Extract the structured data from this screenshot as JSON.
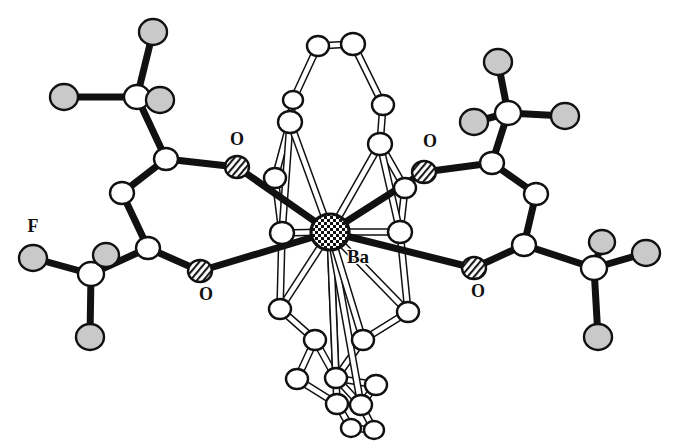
{
  "figure": {
    "kind": "crystal-structure-ortep-diagram",
    "title": "",
    "caption": "",
    "background_color": "#ffffff",
    "line_color": "#111111",
    "fill_white": "#ffffff",
    "fill_gray": "#c9c9c9",
    "metal_fill": "#1a1a1a"
  },
  "labels": [
    {
      "id": "label-o-upper-left",
      "text": "O",
      "x": 237,
      "y": 141,
      "kind": "oxygen"
    },
    {
      "id": "label-o-lower-left",
      "text": "O",
      "x": 206,
      "y": 296,
      "kind": "oxygen"
    },
    {
      "id": "label-o-upper-right",
      "text": "O",
      "x": 430,
      "y": 143,
      "kind": "oxygen"
    },
    {
      "id": "label-o-lower-right",
      "text": "O",
      "x": 478,
      "y": 293,
      "kind": "oxygen"
    },
    {
      "id": "label-f-left",
      "text": "F",
      "x": 33,
      "y": 228,
      "kind": "fluorine"
    },
    {
      "id": "label-ba-center",
      "text": "Ba",
      "x": 358,
      "y": 259,
      "kind": "metal"
    }
  ],
  "chart_data": {
    "type": "scatter",
    "xlabel": "",
    "ylabel": "",
    "legend": [
      {
        "name": "carbon / backbone atom",
        "style": "white ellipse, black outline"
      },
      {
        "name": "fluorine atom",
        "style": "light gray ellipse"
      },
      {
        "name": "oxygen atom",
        "style": "white ellipse with diagonal hatch"
      },
      {
        "name": "barium atom",
        "style": "checkerboard-filled ellipse"
      }
    ],
    "atoms": [
      {
        "id": "Ba1",
        "element": "Ba",
        "x": 330,
        "y": 232,
        "rx": 19,
        "ry": 18,
        "style": "metal"
      },
      {
        "id": "O1",
        "element": "O",
        "x": 237,
        "y": 167,
        "rx": 12,
        "ry": 11,
        "style": "hatch"
      },
      {
        "id": "O2",
        "element": "O",
        "x": 200,
        "y": 271,
        "rx": 12,
        "ry": 11,
        "style": "hatch"
      },
      {
        "id": "O3",
        "element": "O",
        "x": 424,
        "y": 172,
        "rx": 12,
        "ry": 11,
        "style": "hatch"
      },
      {
        "id": "O4",
        "element": "O",
        "x": 474,
        "y": 268,
        "rx": 12,
        "ry": 11,
        "style": "hatch"
      },
      {
        "id": "C1",
        "element": "C",
        "x": 166,
        "y": 159,
        "rx": 12,
        "ry": 11,
        "style": "white"
      },
      {
        "id": "C2",
        "element": "C",
        "x": 122,
        "y": 193,
        "rx": 12,
        "ry": 11,
        "style": "white"
      },
      {
        "id": "C3",
        "element": "C",
        "x": 148,
        "y": 248,
        "rx": 12,
        "ry": 11,
        "style": "white"
      },
      {
        "id": "C4",
        "element": "C",
        "x": 137,
        "y": 97,
        "rx": 13,
        "ry": 12,
        "style": "white"
      },
      {
        "id": "C5",
        "element": "C",
        "x": 91,
        "y": 274,
        "rx": 13,
        "ry": 12,
        "style": "white"
      },
      {
        "id": "F1",
        "element": "F",
        "x": 153,
        "y": 32,
        "rx": 14,
        "ry": 13,
        "style": "gray"
      },
      {
        "id": "F2",
        "element": "F",
        "x": 64,
        "y": 97,
        "rx": 14,
        "ry": 13,
        "style": "gray"
      },
      {
        "id": "F3",
        "element": "F",
        "x": 160,
        "y": 100,
        "rx": 14,
        "ry": 13,
        "style": "gray"
      },
      {
        "id": "F4",
        "element": "F",
        "x": 33,
        "y": 258,
        "rx": 14,
        "ry": 13,
        "style": "gray"
      },
      {
        "id": "F5",
        "element": "F",
        "x": 106,
        "y": 255,
        "rx": 13,
        "ry": 12,
        "style": "gray"
      },
      {
        "id": "F6",
        "element": "F",
        "x": 90,
        "y": 337,
        "rx": 14,
        "ry": 13,
        "style": "gray"
      },
      {
        "id": "C6",
        "element": "C",
        "x": 492,
        "y": 163,
        "rx": 12,
        "ry": 11,
        "style": "white"
      },
      {
        "id": "C7",
        "element": "C",
        "x": 536,
        "y": 194,
        "rx": 12,
        "ry": 11,
        "style": "white"
      },
      {
        "id": "C8",
        "element": "C",
        "x": 524,
        "y": 245,
        "rx": 12,
        "ry": 11,
        "style": "white"
      },
      {
        "id": "C9",
        "element": "C",
        "x": 508,
        "y": 113,
        "rx": 13,
        "ry": 12,
        "style": "white"
      },
      {
        "id": "C10",
        "element": "C",
        "x": 594,
        "y": 268,
        "rx": 13,
        "ry": 12,
        "style": "white"
      },
      {
        "id": "F7",
        "element": "F",
        "x": 498,
        "y": 62,
        "rx": 14,
        "ry": 13,
        "style": "gray"
      },
      {
        "id": "F8",
        "element": "F",
        "x": 474,
        "y": 122,
        "rx": 14,
        "ry": 13,
        "style": "gray"
      },
      {
        "id": "F9",
        "element": "F",
        "x": 565,
        "y": 116,
        "rx": 14,
        "ry": 13,
        "style": "gray"
      },
      {
        "id": "F10",
        "element": "F",
        "x": 646,
        "y": 253,
        "rx": 14,
        "ry": 13,
        "style": "gray"
      },
      {
        "id": "F11",
        "element": "F",
        "x": 602,
        "y": 242,
        "rx": 13,
        "ry": 12,
        "style": "gray"
      },
      {
        "id": "F12",
        "element": "F",
        "x": 598,
        "y": 337,
        "rx": 14,
        "ry": 13,
        "style": "gray"
      },
      {
        "id": "R1",
        "element": "C",
        "x": 318,
        "y": 46,
        "rx": 11,
        "ry": 10,
        "style": "white"
      },
      {
        "id": "R2",
        "element": "C",
        "x": 353,
        "y": 44,
        "rx": 12,
        "ry": 11,
        "style": "white"
      },
      {
        "id": "R3",
        "element": "C",
        "x": 293,
        "y": 100,
        "rx": 10,
        "ry": 9,
        "style": "white"
      },
      {
        "id": "R4",
        "element": "C",
        "x": 290,
        "y": 122,
        "rx": 12,
        "ry": 11,
        "style": "white"
      },
      {
        "id": "R5",
        "element": "C",
        "x": 383,
        "y": 105,
        "rx": 11,
        "ry": 10,
        "style": "white"
      },
      {
        "id": "R6",
        "element": "C",
        "x": 380,
        "y": 144,
        "rx": 12,
        "ry": 11,
        "style": "white"
      },
      {
        "id": "R7",
        "element": "C",
        "x": 275,
        "y": 178,
        "rx": 11,
        "ry": 10,
        "style": "white"
      },
      {
        "id": "R8",
        "element": "C",
        "x": 405,
        "y": 188,
        "rx": 11,
        "ry": 10,
        "style": "white"
      },
      {
        "id": "R9",
        "element": "C",
        "x": 282,
        "y": 233,
        "rx": 12,
        "ry": 11,
        "style": "white"
      },
      {
        "id": "R10",
        "element": "C",
        "x": 400,
        "y": 232,
        "rx": 12,
        "ry": 11,
        "style": "white"
      },
      {
        "id": "R11",
        "element": "C",
        "x": 280,
        "y": 309,
        "rx": 11,
        "ry": 10,
        "style": "white"
      },
      {
        "id": "R12",
        "element": "C",
        "x": 408,
        "y": 312,
        "rx": 11,
        "ry": 10,
        "style": "white"
      },
      {
        "id": "R13",
        "element": "C",
        "x": 315,
        "y": 340,
        "rx": 11,
        "ry": 10,
        "style": "white"
      },
      {
        "id": "R14",
        "element": "C",
        "x": 363,
        "y": 340,
        "rx": 11,
        "ry": 10,
        "style": "white"
      },
      {
        "id": "R15",
        "element": "C",
        "x": 297,
        "y": 379,
        "rx": 11,
        "ry": 10,
        "style": "white"
      },
      {
        "id": "R16",
        "element": "C",
        "x": 336,
        "y": 378,
        "rx": 11,
        "ry": 10,
        "style": "white"
      },
      {
        "id": "R17",
        "element": "C",
        "x": 376,
        "y": 385,
        "rx": 11,
        "ry": 10,
        "style": "white"
      },
      {
        "id": "R18",
        "element": "C",
        "x": 337,
        "y": 404,
        "rx": 11,
        "ry": 10,
        "style": "white"
      },
      {
        "id": "R19",
        "element": "C",
        "x": 361,
        "y": 405,
        "rx": 11,
        "ry": 10,
        "style": "white"
      },
      {
        "id": "R20",
        "element": "C",
        "x": 351,
        "y": 428,
        "rx": 10,
        "ry": 9,
        "style": "white"
      },
      {
        "id": "R21",
        "element": "C",
        "x": 374,
        "y": 430,
        "rx": 10,
        "ry": 9,
        "style": "white"
      }
    ],
    "bonds_thick": [
      [
        "C4",
        "F1"
      ],
      [
        "C4",
        "F2"
      ],
      [
        "C4",
        "F3"
      ],
      [
        "C4",
        "C1"
      ],
      [
        "C1",
        "C2"
      ],
      [
        "C2",
        "C3"
      ],
      [
        "C1",
        "O1"
      ],
      [
        "C3",
        "O2"
      ],
      [
        "C3",
        "C5"
      ],
      [
        "C5",
        "F4"
      ],
      [
        "C5",
        "F5"
      ],
      [
        "C5",
        "F6"
      ],
      [
        "O1",
        "Ba1"
      ],
      [
        "O2",
        "Ba1"
      ],
      [
        "C9",
        "F7"
      ],
      [
        "C9",
        "F8"
      ],
      [
        "C9",
        "F9"
      ],
      [
        "C9",
        "C6"
      ],
      [
        "C6",
        "C7"
      ],
      [
        "C7",
        "C8"
      ],
      [
        "C6",
        "O3"
      ],
      [
        "C8",
        "O4"
      ],
      [
        "C8",
        "C10"
      ],
      [
        "C10",
        "F10"
      ],
      [
        "C10",
        "F11"
      ],
      [
        "C10",
        "F12"
      ],
      [
        "O3",
        "Ba1"
      ],
      [
        "O4",
        "Ba1"
      ]
    ],
    "bonds_hollow": [
      [
        "R1",
        "R2"
      ],
      [
        "R1",
        "R3"
      ],
      [
        "R3",
        "R4"
      ],
      [
        "R2",
        "R5"
      ],
      [
        "R5",
        "R6"
      ],
      [
        "R4",
        "R7"
      ],
      [
        "R6",
        "R8"
      ],
      [
        "R7",
        "R9"
      ],
      [
        "R8",
        "R10"
      ],
      [
        "R4",
        "R9"
      ],
      [
        "R6",
        "R10"
      ],
      [
        "R9",
        "Ba1"
      ],
      [
        "R10",
        "Ba1"
      ],
      [
        "R4",
        "Ba1"
      ],
      [
        "R6",
        "Ba1"
      ],
      [
        "R9",
        "R11"
      ],
      [
        "R10",
        "R12"
      ],
      [
        "R11",
        "R13"
      ],
      [
        "R12",
        "R14"
      ],
      [
        "R13",
        "R15"
      ],
      [
        "R14",
        "R16"
      ],
      [
        "R15",
        "R18"
      ],
      [
        "R16",
        "R17"
      ],
      [
        "R17",
        "R19"
      ],
      [
        "R18",
        "R20"
      ],
      [
        "R19",
        "R21"
      ],
      [
        "R20",
        "R21"
      ],
      [
        "R16",
        "R19"
      ],
      [
        "R13",
        "R16"
      ],
      [
        "R11",
        "Ba1"
      ],
      [
        "R12",
        "Ba1"
      ],
      [
        "R16",
        "Ba1"
      ],
      [
        "R18",
        "Ba1"
      ],
      [
        "R19",
        "Ba1"
      ],
      [
        "R14",
        "Ba1"
      ]
    ]
  }
}
